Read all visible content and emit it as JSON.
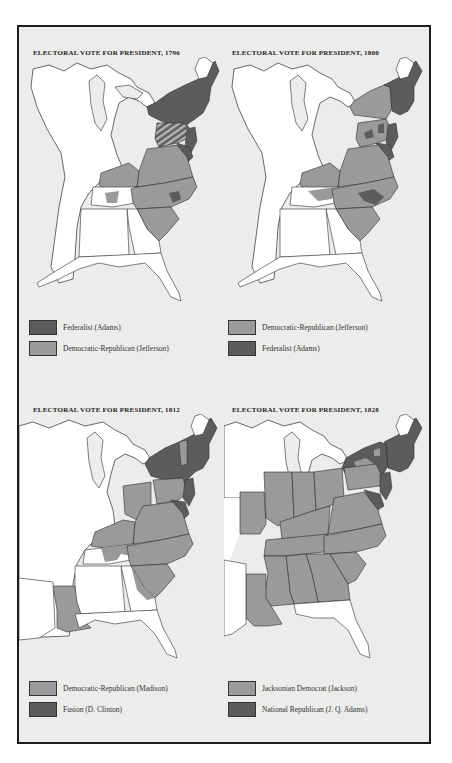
{
  "colors": {
    "frame_border": "#1e1e1e",
    "background": "#ececeb",
    "land_uncolored": "#ffffff",
    "federalist_dark": "#5c5c5c",
    "republican_light": "#9a9a9a",
    "outline": "#2b2b2b"
  },
  "panels": [
    {
      "title": "ELECTORAL VOTE FOR PRESIDENT, 1796",
      "legend": [
        {
          "label": "Federalist (Adams)",
          "color": "#5c5c5c"
        },
        {
          "label": "Democratic-Republican (Jefferson)",
          "color": "#9a9a9a"
        }
      ]
    },
    {
      "title": "ELECTORAL VOTE FOR PRESIDENT, 1800",
      "legend": [
        {
          "label": "Democratic-Republican (Jefferson)",
          "color": "#9a9a9a"
        },
        {
          "label": "Federalist (Adams)",
          "color": "#5c5c5c"
        }
      ]
    },
    {
      "title": "ELECTORAL VOTE FOR PRESIDENT, 1812",
      "legend": [
        {
          "label": "Democratic-Republican (Madison)",
          "color": "#9a9a9a"
        },
        {
          "label": "Fusion (D. Clinton)",
          "color": "#5c5c5c"
        }
      ]
    },
    {
      "title": "ELECTORAL VOTE FOR PRESIDENT, 1828",
      "legend": [
        {
          "label": "Jacksonian Democrat (Jackson)",
          "color": "#9a9a9a"
        },
        {
          "label": "National Republican (J. Q. Adams)",
          "color": "#5c5c5c"
        }
      ]
    }
  ]
}
